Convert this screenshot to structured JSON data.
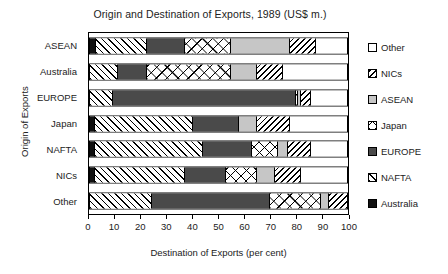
{
  "chart_data": {
    "type": "bar",
    "orientation": "horizontal",
    "stacked": true,
    "title": "Origin and Destination of Exports, 1989 (US$ m.)",
    "xlabel": "Destination of Exports (per cent)",
    "ylabel": "Origin of Exports",
    "xlim": [
      0,
      100
    ],
    "xticks": [
      0,
      10,
      20,
      30,
      40,
      50,
      60,
      70,
      80,
      90,
      100
    ],
    "grid": false,
    "legend_position": "right",
    "categories": [
      "ASEAN",
      "Australia",
      "EUROPE",
      "Japan",
      "NAFTA",
      "NICs",
      "Other"
    ],
    "series": [
      {
        "name": "Australia",
        "pattern": "solid-black",
        "values": [
          2.5,
          0.0,
          0.0,
          2.0,
          2.0,
          2.0,
          0.0
        ]
      },
      {
        "name": "NAFTA",
        "pattern": "diagonal-fwd",
        "values": [
          19.5,
          11.0,
          9.0,
          38.0,
          42.0,
          35.0,
          24.0
        ]
      },
      {
        "name": "EUROPE",
        "pattern": "solid-dark",
        "values": [
          15.0,
          11.0,
          71.0,
          18.0,
          19.0,
          16.0,
          46.0
        ]
      },
      {
        "name": "Japan",
        "pattern": "cross-hatch",
        "values": [
          18.0,
          33.0,
          1.0,
          0.0,
          10.0,
          12.0,
          20.0
        ]
      },
      {
        "name": "ASEAN",
        "pattern": "solid-light",
        "values": [
          23.0,
          10.0,
          1.0,
          7.0,
          4.0,
          7.0,
          3.0
        ]
      },
      {
        "name": "NICs",
        "pattern": "diagonal-back",
        "values": [
          10.0,
          10.0,
          4.0,
          13.0,
          9.0,
          10.0,
          7.0
        ]
      },
      {
        "name": "Other",
        "pattern": "white",
        "values": [
          12.0,
          25.0,
          14.0,
          22.0,
          14.0,
          18.0,
          0.0
        ]
      }
    ],
    "legend_entries": [
      {
        "label": "Other",
        "pattern": "white"
      },
      {
        "label": "NICs",
        "pattern": "diagonal-back"
      },
      {
        "label": "ASEAN",
        "pattern": "solid-light"
      },
      {
        "label": "Japan",
        "pattern": "cross-hatch"
      },
      {
        "label": "EUROPE",
        "pattern": "solid-dark"
      },
      {
        "label": "NAFTA",
        "pattern": "diagonal-fwd"
      },
      {
        "label": "Australia",
        "pattern": "solid-black"
      }
    ]
  }
}
